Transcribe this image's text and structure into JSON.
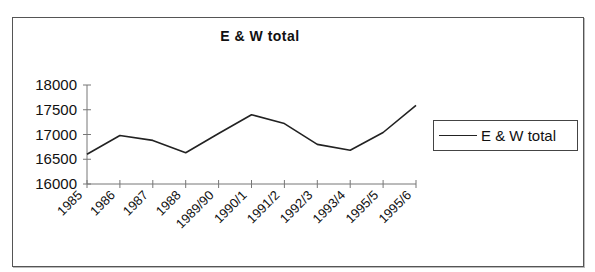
{
  "chart_data": {
    "type": "line",
    "title": "E & W total",
    "xlabel": "",
    "ylabel": "",
    "categories": [
      "1985",
      "1986",
      "1987",
      "1988",
      "1989/90",
      "1990/1",
      "1991/2",
      "1992/3",
      "1993/4",
      "1995/5",
      "1995/6"
    ],
    "series": [
      {
        "name": "E & W total",
        "values": [
          16600,
          16980,
          16880,
          16630,
          17020,
          17400,
          17220,
          16800,
          16680,
          17040,
          17590
        ],
        "color": "#222222"
      }
    ],
    "ylim": [
      16000,
      18000
    ],
    "yticks": [
      "18000",
      "17500",
      "17000",
      "16500",
      "16000"
    ],
    "grid": false,
    "legend_position": "right"
  },
  "chart": {
    "title": "E & W total",
    "legend_label": "E & W total"
  }
}
